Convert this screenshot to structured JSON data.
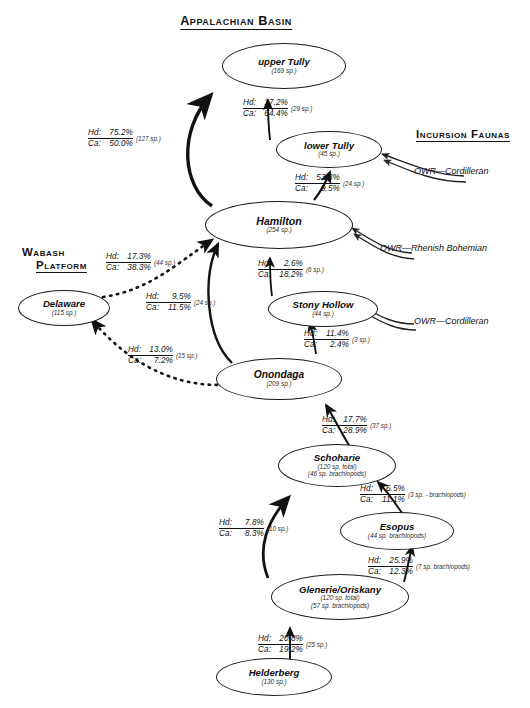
{
  "headings": {
    "basin": "Appalachian Basin",
    "incursion_faunas": "Incursion Faunas",
    "wabash_line1": "Wabash",
    "wabash_line2": "Platform"
  },
  "nodes": [
    {
      "id": "upper-tully",
      "name": "upper Tully",
      "sub1": "(169 sp.)",
      "sub2": ""
    },
    {
      "id": "lower-tully",
      "name": "lower Tully",
      "sub1": "(45 sp.)",
      "sub2": ""
    },
    {
      "id": "hamilton",
      "name": "Hamilton",
      "sub1": "(254 sp.)",
      "sub2": ""
    },
    {
      "id": "stony-hollow",
      "name": "Stony Hollow",
      "sub1": "(44 sp.)",
      "sub2": ""
    },
    {
      "id": "delaware",
      "name": "Delaware",
      "sub1": "(115 sp.)",
      "sub2": ""
    },
    {
      "id": "onondaga",
      "name": "Onondaga",
      "sub1": "(209 sp.)",
      "sub2": ""
    },
    {
      "id": "schoharie",
      "name": "Schoharie",
      "sub1": "(120 sp. total)",
      "sub2": "(46 sp. brachiopods)"
    },
    {
      "id": "esopus",
      "name": "Esopus",
      "sub1": "(44 sp. brachiopods)",
      "sub2": ""
    },
    {
      "id": "glenerie-oriskany",
      "name": "Glenerie/Oriskany",
      "sub1": "(120 sp. total)",
      "sub2": "(57 sp. brachiopods)"
    },
    {
      "id": "helderberg",
      "name": "Helderberg",
      "sub1": "(130 sp.)",
      "sub2": ""
    }
  ],
  "links": [
    {
      "id": "hamilton-to-upper-tully",
      "hd_key": "Hd:",
      "hd": "75.2%",
      "ca_key": "Ca:",
      "ca": "50.0%",
      "sp": "(127 sp.)"
    },
    {
      "id": "lower-tully-to-upper-tully",
      "hd_key": "Hd:",
      "hd": "17.2%",
      "ca_key": "Ca:",
      "ca": "64.4%",
      "sp": "(29 sp.)"
    },
    {
      "id": "hamilton-to-lower-tully",
      "hd_key": "Hd:",
      "hd": "53.3%",
      "ca_key": "Ca:",
      "ca": "9.5%",
      "sp": "(24 sp.)"
    },
    {
      "id": "delaware-to-hamilton",
      "hd_key": "Hd:",
      "hd": "17.3%",
      "ca_key": "Ca:",
      "ca": "38.3%",
      "sp": "(44 sp.)"
    },
    {
      "id": "stony-hollow-to-hamilton",
      "hd_key": "Hd:",
      "hd": "2.6%",
      "ca_key": "Ca:",
      "ca": "18.2%",
      "sp": "(6 sp.)"
    },
    {
      "id": "onondaga-to-hamilton",
      "hd_key": "Hd:",
      "hd": "9.5%",
      "ca_key": "Ca:",
      "ca": "11.5%",
      "sp": "(24 sp.)"
    },
    {
      "id": "onondaga-to-stony-hollow",
      "hd_key": "Hd:",
      "hd": "11.4%",
      "ca_key": "Ca:",
      "ca": "2.4%",
      "sp": "(3 sp.)"
    },
    {
      "id": "onondaga-to-delaware",
      "hd_key": "Hd:",
      "hd": "13.0%",
      "ca_key": "Ca:",
      "ca": "7.2%",
      "sp": "(15 sp.)"
    },
    {
      "id": "schoharie-to-onondaga",
      "hd_key": "Hd:",
      "hd": "17.7%",
      "ca_key": "Ca:",
      "ca": "28.9%",
      "sp": "(37 sp.)"
    },
    {
      "id": "esopus-to-schoharie",
      "hd_key": "Hd:",
      "hd": "6.5%",
      "ca_key": "Ca:",
      "ca": "11.1%",
      "sp": "(3 sp. - brachiopods)"
    },
    {
      "id": "glenerie-to-schoharie",
      "hd_key": "Hd:",
      "hd": "7.8%",
      "ca_key": "Ca:",
      "ca": "8.3%",
      "sp": "(10 sp.)"
    },
    {
      "id": "glenerie-to-esopus",
      "hd_key": "Hd:",
      "hd": "25.9%",
      "ca_key": "Ca:",
      "ca": "12.3%",
      "sp": "(7 sp. brachiopods)"
    },
    {
      "id": "helderberg-to-glenerie",
      "hd_key": "Hd:",
      "hd": "20.8%",
      "ca_key": "Ca:",
      "ca": "19.2%",
      "sp": "(25 sp.)"
    }
  ],
  "incursion_labels": [
    {
      "id": "owr-cordilleran-tully",
      "text": "OWR—Cordilleran"
    },
    {
      "id": "owr-rhenish-bohemian",
      "text": "OWR—Rhenish Bohemian"
    },
    {
      "id": "owr-cordilleran-stony",
      "text": "OWR—Cordilleran"
    }
  ],
  "caption": " "
}
